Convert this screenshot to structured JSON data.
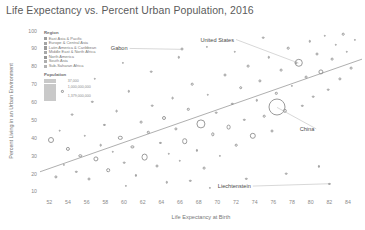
{
  "chart_data": {
    "type": "scatter",
    "title": "Life Expectancy vs. Percent Urban Population, 2016",
    "xlabel": "Life Expectancy at Birth",
    "ylabel": "Percent Living in an Urban Environment",
    "xlim": [
      51,
      85.5
    ],
    "ylim": [
      8,
      102
    ],
    "xticks": [
      52,
      54,
      56,
      58,
      60,
      62,
      64,
      66,
      68,
      70,
      72,
      74,
      76,
      78,
      80,
      82,
      84
    ],
    "yticks": [
      10,
      20,
      30,
      40,
      50,
      60,
      70,
      80,
      90,
      100
    ],
    "grid": false,
    "legend_position": "top-left",
    "trendline": {
      "x0": 51,
      "y0": 21,
      "x1": 85.5,
      "y1": 84
    },
    "annotations": [
      {
        "label": "Gabon",
        "x": 66.2,
        "y": 89.5,
        "tx": 60.6,
        "ty": 90.0
      },
      {
        "label": "United States",
        "x": 78.7,
        "y": 81.8,
        "tx": 72.0,
        "ty": 95.0
      },
      {
        "label": "China",
        "x": 76.4,
        "y": 57.0,
        "tx": 80.6,
        "ty": 45.0
      },
      {
        "label": "Liechtenstein",
        "x": 82.0,
        "y": 14.3,
        "tx": 73.8,
        "ty": 13.0
      }
    ],
    "points": [
      {
        "x": 52.2,
        "y": 39,
        "r": 3.0
      },
      {
        "x": 52.7,
        "y": 18,
        "r": 1.6
      },
      {
        "x": 53.1,
        "y": 44,
        "r": 1.3
      },
      {
        "x": 53.6,
        "y": 25,
        "r": 1.1
      },
      {
        "x": 54.0,
        "y": 34,
        "r": 2.1
      },
      {
        "x": 54.4,
        "y": 53,
        "r": 1.4
      },
      {
        "x": 54.9,
        "y": 21,
        "r": 1.2
      },
      {
        "x": 55.3,
        "y": 30,
        "r": 1.7
      },
      {
        "x": 55.8,
        "y": 41,
        "r": 1.2
      },
      {
        "x": 56.2,
        "y": 17,
        "r": 1.5
      },
      {
        "x": 56.6,
        "y": 60,
        "r": 1.2
      },
      {
        "x": 57.0,
        "y": 28,
        "r": 2.6
      },
      {
        "x": 57.5,
        "y": 36,
        "r": 1.3
      },
      {
        "x": 57.9,
        "y": 47,
        "r": 1.1
      },
      {
        "x": 58.3,
        "y": 22,
        "r": 1.8
      },
      {
        "x": 58.8,
        "y": 32,
        "r": 1.2
      },
      {
        "x": 59.2,
        "y": 55,
        "r": 1.4
      },
      {
        "x": 59.6,
        "y": 40,
        "r": 2.2
      },
      {
        "x": 60.0,
        "y": 26,
        "r": 1.3
      },
      {
        "x": 60.5,
        "y": 66,
        "r": 1.2
      },
      {
        "x": 60.9,
        "y": 35,
        "r": 1.6
      },
      {
        "x": 61.3,
        "y": 19,
        "r": 1.1
      },
      {
        "x": 61.8,
        "y": 49,
        "r": 1.4
      },
      {
        "x": 62.2,
        "y": 29,
        "r": 3.4
      },
      {
        "x": 62.6,
        "y": 43,
        "r": 1.2
      },
      {
        "x": 63.0,
        "y": 58,
        "r": 1.3
      },
      {
        "x": 63.5,
        "y": 24,
        "r": 1.5
      },
      {
        "x": 63.9,
        "y": 37,
        "r": 1.1
      },
      {
        "x": 64.3,
        "y": 51,
        "r": 2.0
      },
      {
        "x": 64.8,
        "y": 31,
        "r": 1.2
      },
      {
        "x": 65.2,
        "y": 62,
        "r": 1.4
      },
      {
        "x": 65.6,
        "y": 45,
        "r": 1.6
      },
      {
        "x": 66.0,
        "y": 27,
        "r": 1.2
      },
      {
        "x": 66.2,
        "y": 89.5,
        "r": 1.5
      },
      {
        "x": 66.5,
        "y": 38,
        "r": 2.8
      },
      {
        "x": 66.9,
        "y": 56,
        "r": 1.2
      },
      {
        "x": 67.3,
        "y": 70,
        "r": 1.3
      },
      {
        "x": 67.8,
        "y": 33,
        "r": 1.1
      },
      {
        "x": 68.2,
        "y": 48,
        "r": 4.6
      },
      {
        "x": 68.6,
        "y": 23,
        "r": 1.4
      },
      {
        "x": 69.0,
        "y": 64,
        "r": 1.2
      },
      {
        "x": 69.5,
        "y": 42,
        "r": 1.7
      },
      {
        "x": 69.9,
        "y": 54,
        "r": 1.3
      },
      {
        "x": 70.3,
        "y": 30,
        "r": 1.1
      },
      {
        "x": 70.8,
        "y": 75,
        "r": 1.5
      },
      {
        "x": 71.2,
        "y": 46,
        "r": 2.4
      },
      {
        "x": 71.6,
        "y": 59,
        "r": 1.2
      },
      {
        "x": 72.0,
        "y": 36,
        "r": 1.3
      },
      {
        "x": 72.5,
        "y": 68,
        "r": 1.8
      },
      {
        "x": 72.9,
        "y": 50,
        "r": 1.2
      },
      {
        "x": 73.3,
        "y": 80,
        "r": 1.4
      },
      {
        "x": 73.8,
        "y": 41,
        "r": 3.2
      },
      {
        "x": 74.2,
        "y": 61,
        "r": 1.2
      },
      {
        "x": 74.6,
        "y": 72,
        "r": 1.6
      },
      {
        "x": 75.0,
        "y": 52,
        "r": 1.3
      },
      {
        "x": 75.5,
        "y": 85,
        "r": 1.2
      },
      {
        "x": 75.9,
        "y": 44,
        "r": 1.5
      },
      {
        "x": 76.3,
        "y": 65,
        "r": 1.2
      },
      {
        "x": 76.4,
        "y": 57,
        "r": 8.5
      },
      {
        "x": 76.8,
        "y": 78,
        "r": 1.4
      },
      {
        "x": 77.2,
        "y": 55,
        "r": 2.2
      },
      {
        "x": 77.6,
        "y": 90,
        "r": 1.3
      },
      {
        "x": 78.0,
        "y": 69,
        "r": 1.1
      },
      {
        "x": 78.4,
        "y": 82,
        "r": 1.6
      },
      {
        "x": 78.7,
        "y": 81.8,
        "r": 4.2
      },
      {
        "x": 79.1,
        "y": 58,
        "r": 1.2
      },
      {
        "x": 79.5,
        "y": 74,
        "r": 1.4
      },
      {
        "x": 79.9,
        "y": 94,
        "r": 1.2
      },
      {
        "x": 80.3,
        "y": 63,
        "r": 1.3
      },
      {
        "x": 80.7,
        "y": 87,
        "r": 1.5
      },
      {
        "x": 81.1,
        "y": 77,
        "r": 2.6
      },
      {
        "x": 81.5,
        "y": 97,
        "r": 1.2
      },
      {
        "x": 81.9,
        "y": 67,
        "r": 1.3
      },
      {
        "x": 82.0,
        "y": 14.3,
        "r": 1.1
      },
      {
        "x": 82.3,
        "y": 84,
        "r": 1.4
      },
      {
        "x": 82.7,
        "y": 92,
        "r": 1.2
      },
      {
        "x": 83.1,
        "y": 73,
        "r": 1.6
      },
      {
        "x": 83.5,
        "y": 98,
        "r": 1.3
      },
      {
        "x": 83.9,
        "y": 88,
        "r": 1.2
      },
      {
        "x": 84.3,
        "y": 79,
        "r": 1.4
      },
      {
        "x": 84.7,
        "y": 95,
        "r": 1.1
      },
      {
        "x": 53.4,
        "y": 66,
        "r": 1.1
      },
      {
        "x": 56.9,
        "y": 73,
        "r": 1.2
      },
      {
        "x": 59.9,
        "y": 82,
        "r": 1.1
      },
      {
        "x": 62.9,
        "y": 77,
        "r": 1.3
      },
      {
        "x": 65.9,
        "y": 85,
        "r": 1.2
      },
      {
        "x": 68.9,
        "y": 91,
        "r": 1.1
      },
      {
        "x": 71.9,
        "y": 88,
        "r": 1.2
      },
      {
        "x": 74.9,
        "y": 96,
        "r": 1.3
      },
      {
        "x": 60.2,
        "y": 13,
        "r": 1.1
      },
      {
        "x": 64.6,
        "y": 15,
        "r": 1.2
      },
      {
        "x": 69.2,
        "y": 12,
        "r": 1.1
      },
      {
        "x": 73.1,
        "y": 17,
        "r": 1.2
      },
      {
        "x": 77.4,
        "y": 20,
        "r": 1.3
      },
      {
        "x": 80.9,
        "y": 24,
        "r": 1.1
      },
      {
        "x": 67.1,
        "y": 16,
        "r": 1.2
      }
    ]
  },
  "legend": {
    "region_title": "Region",
    "regions": [
      {
        "label": "East Asia & Pacific",
        "color": "#9d9d9d"
      },
      {
        "label": "Europe & Central Asia",
        "color": "#a5a5a5"
      },
      {
        "label": "Latin America & Caribbean",
        "color": "#9a9a9a"
      },
      {
        "label": "Middle East & North Africa",
        "color": "#a8a8a8"
      },
      {
        "label": "North America",
        "color": "#969696"
      },
      {
        "label": "South Asia",
        "color": "#aeaeae"
      },
      {
        "label": "Sub-Saharan Africa",
        "color": "#b3b3b3"
      }
    ],
    "population_title": "Population",
    "population_sizes": [
      {
        "label": "37,000",
        "size": 3
      },
      {
        "label": "1,000,000,000",
        "size": 6
      },
      {
        "label": "1,379,000,000",
        "size": 9
      }
    ]
  }
}
